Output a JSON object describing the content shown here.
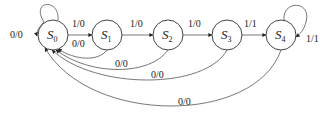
{
  "diagram": {
    "type": "finite-state-machine",
    "states": [
      {
        "id": "S0",
        "letter": "S",
        "sub": "0"
      },
      {
        "id": "S1",
        "letter": "S",
        "sub": "1"
      },
      {
        "id": "S2",
        "letter": "S",
        "sub": "2"
      },
      {
        "id": "S3",
        "letter": "S",
        "sub": "3"
      },
      {
        "id": "S4",
        "letter": "S",
        "sub": "4"
      }
    ],
    "transitions": [
      {
        "from": "S0",
        "to": "S0",
        "label": "0/0"
      },
      {
        "from": "S0",
        "to": "S1",
        "label": "1/0"
      },
      {
        "from": "S1",
        "to": "S0",
        "label": "0/0"
      },
      {
        "from": "S1",
        "to": "S2",
        "label": "1/0"
      },
      {
        "from": "S2",
        "to": "S0",
        "label": "0/0"
      },
      {
        "from": "S2",
        "to": "S3",
        "label": "1/0"
      },
      {
        "from": "S3",
        "to": "S0",
        "label": "0/0"
      },
      {
        "from": "S3",
        "to": "S4",
        "label": "1/1"
      },
      {
        "from": "S4",
        "to": "S4",
        "label": "1/1"
      },
      {
        "from": "S4",
        "to": "S0",
        "label": "0/0"
      }
    ]
  }
}
